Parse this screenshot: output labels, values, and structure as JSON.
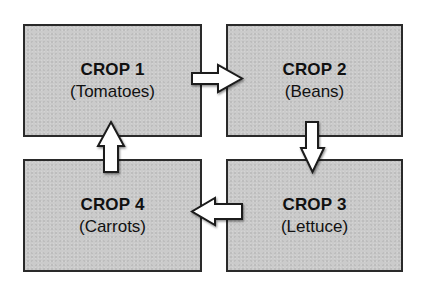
{
  "diagram": {
    "type": "crop-rotation-cycle",
    "boxes": [
      {
        "id": "crop1",
        "title": "CROP 1",
        "subtitle": "(Tomatoes)"
      },
      {
        "id": "crop2",
        "title": "CROP 2",
        "subtitle": "(Beans)"
      },
      {
        "id": "crop3",
        "title": "CROP 3",
        "subtitle": "(Lettuce)"
      },
      {
        "id": "crop4",
        "title": "CROP 4",
        "subtitle": "(Carrots)"
      }
    ],
    "arrows": [
      {
        "from": "crop1",
        "to": "crop2",
        "direction": "right"
      },
      {
        "from": "crop2",
        "to": "crop3",
        "direction": "down"
      },
      {
        "from": "crop3",
        "to": "crop4",
        "direction": "left"
      },
      {
        "from": "crop4",
        "to": "crop1",
        "direction": "up"
      }
    ],
    "colors": {
      "box_fill": "#cbcbcb",
      "box_border": "#2a2a2a",
      "arrow_fill": "#ffffff",
      "text": "#111111"
    }
  }
}
